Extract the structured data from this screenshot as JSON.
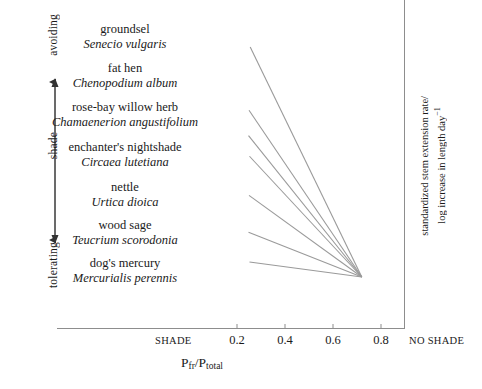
{
  "gradient_axis": {
    "top_label": "avoiding",
    "middle_label": "shade",
    "bottom_label": "tolerating"
  },
  "species": [
    {
      "common": "groundsel",
      "latin": "Senecio vulgaris"
    },
    {
      "common": "fat hen",
      "latin": "Chenopodium album"
    },
    {
      "common": "rose-bay willow herb",
      "latin": "Chamaenerion angustifolium"
    },
    {
      "common": "enchanter's nightshade",
      "latin": "Circaea lutetiana"
    },
    {
      "common": "nettle",
      "latin": "Urtica dioica"
    },
    {
      "common": "wood sage",
      "latin": "Teucrium scorodonia"
    },
    {
      "common": "dog's mercury",
      "latin": "Mercurialis perennis"
    }
  ],
  "x_axis": {
    "title_main": "P",
    "title_sub1": "fr",
    "title_slash": "/P",
    "title_sub2": "total",
    "left_end_label": "SHADE",
    "right_end_label": "NO SHADE",
    "ticks": [
      "0.2",
      "0.4",
      "0.6",
      "0.8"
    ]
  },
  "y_axis_right": {
    "line1": "standardized stem extension rate/",
    "line2": "log increase in length day",
    "exponent": "−1"
  },
  "chart_data": {
    "type": "line",
    "title": "",
    "xlabel": "Pfr/Ptotal",
    "ylabel": "standardized stem extension rate/log increase in length day−1",
    "xlim": [
      0.08,
      0.88
    ],
    "ylim": [
      0,
      1
    ],
    "grid": false,
    "legend": "none",
    "note": "Seven species response lines converge at a common point near Pfr/Ptotal = 0.72; slope magnitude decreases from shade-avoiding (top) to shade-tolerating (bottom) species.",
    "convergence_point": {
      "x": 0.72,
      "y": 0.0
    },
    "series": [
      {
        "name": "Senecio vulgaris",
        "x": [
          0.255,
          0.72
        ],
        "values": [
          1.0,
          0.0
        ]
      },
      {
        "name": "Chenopodium album",
        "x": [
          0.25,
          0.72
        ],
        "values": [
          0.725,
          0.0
        ]
      },
      {
        "name": "Chamaenerion angustifolium",
        "x": [
          0.248,
          0.72
        ],
        "values": [
          0.615,
          0.0
        ]
      },
      {
        "name": "Circaea lutetiana",
        "x": [
          0.252,
          0.72
        ],
        "values": [
          0.525,
          0.0
        ]
      },
      {
        "name": "Urtica dioica",
        "x": [
          0.25,
          0.72
        ],
        "values": [
          0.355,
          0.0
        ]
      },
      {
        "name": "Teucrium scorodonia",
        "x": [
          0.248,
          0.72
        ],
        "values": [
          0.195,
          0.0
        ]
      },
      {
        "name": "Mercurialis perennis",
        "x": [
          0.252,
          0.72
        ],
        "values": [
          0.065,
          0.0
        ]
      }
    ]
  }
}
